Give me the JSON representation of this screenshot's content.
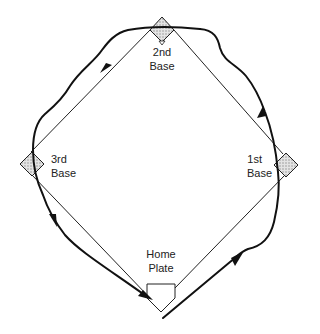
{
  "diagram": {
    "type": "baseball-basepath-diagram",
    "colors": {
      "line": "#222222",
      "bag_fill": "#c8c8c8",
      "background": "#ffffff"
    },
    "bases": [
      {
        "id": "second",
        "line1": "2nd",
        "line2": "Base"
      },
      {
        "id": "third",
        "line1": "3rd",
        "line2": "Base"
      },
      {
        "id": "first",
        "line1": "1st",
        "line2": "Base"
      },
      {
        "id": "home",
        "line1": "Home",
        "line2": "Plate"
      }
    ],
    "runner_path": {
      "description": "Runner path from home plate around 1st, 2nd, 3rd and back to home",
      "arrows": 5
    }
  }
}
